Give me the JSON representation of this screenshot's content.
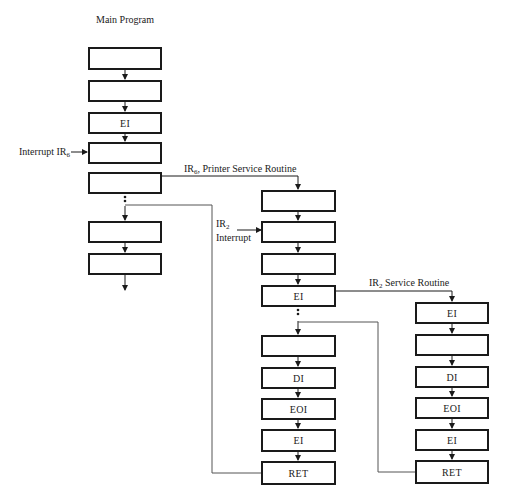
{
  "title": "Main Program",
  "labels": {
    "interrupt_ir6": "Interrupt IR",
    "interrupt_ir6_sub": "6",
    "ir6_routine": "IR",
    "ir6_routine_sub": "6",
    "ir6_routine_rest": ", Printer Service Routine",
    "ir2_interrupt_a": "IR",
    "ir2_interrupt_sub": "2",
    "ir2_interrupt_b": "Interrupt",
    "ir2_routine": "IR",
    "ir2_routine_sub": "2",
    "ir2_routine_rest": " Service Routine"
  },
  "main_program": {
    "boxes": [
      {
        "label": "",
        "top": 47
      },
      {
        "label": "",
        "top": 80
      },
      {
        "label": "EI",
        "top": 112
      },
      {
        "label": "",
        "top": 142
      },
      {
        "label": "",
        "top": 172
      },
      {
        "label": "",
        "top": 221
      },
      {
        "label": "",
        "top": 253
      }
    ]
  },
  "printer_routine": {
    "boxes": [
      {
        "label": "",
        "top": 190
      },
      {
        "label": "",
        "top": 221
      },
      {
        "label": "",
        "top": 253
      },
      {
        "label": "EI",
        "top": 285
      },
      {
        "label": "",
        "top": 335
      },
      {
        "label": "DI",
        "top": 367
      },
      {
        "label": "EOI",
        "top": 398
      },
      {
        "label": "EI",
        "top": 429
      },
      {
        "label": "RET",
        "top": 461
      }
    ]
  },
  "ir2_routine": {
    "boxes": [
      {
        "label": "EI",
        "top": 302
      },
      {
        "label": "",
        "top": 334
      },
      {
        "label": "DI",
        "top": 366
      },
      {
        "label": "EOI",
        "top": 397
      },
      {
        "label": "EI",
        "top": 429
      },
      {
        "label": "RET",
        "top": 460
      }
    ]
  }
}
